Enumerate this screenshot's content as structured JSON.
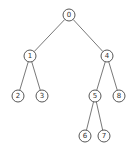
{
  "diagram": {
    "type": "binary-tree",
    "node_radius": 6,
    "colors": {
      "stroke": "#444444",
      "edge": "#555555",
      "fill": "#ffffff",
      "text": "#333333"
    },
    "nodes": [
      {
        "id": "0",
        "label": "0",
        "x": 69,
        "y": 15
      },
      {
        "id": "1",
        "label": "1",
        "x": 30,
        "y": 56
      },
      {
        "id": "4",
        "label": "4",
        "x": 107,
        "y": 56
      },
      {
        "id": "2",
        "label": "2",
        "x": 18,
        "y": 96
      },
      {
        "id": "3",
        "label": "3",
        "x": 42,
        "y": 96
      },
      {
        "id": "5",
        "label": "5",
        "x": 95,
        "y": 96
      },
      {
        "id": "8",
        "label": "8",
        "x": 119,
        "y": 96
      },
      {
        "id": "6",
        "label": "6",
        "x": 85,
        "y": 136
      },
      {
        "id": "7",
        "label": "7",
        "x": 104,
        "y": 136
      }
    ],
    "edges": [
      {
        "from": "0",
        "to": "1"
      },
      {
        "from": "0",
        "to": "4"
      },
      {
        "from": "1",
        "to": "2"
      },
      {
        "from": "1",
        "to": "3"
      },
      {
        "from": "4",
        "to": "5"
      },
      {
        "from": "4",
        "to": "8"
      },
      {
        "from": "5",
        "to": "6"
      },
      {
        "from": "5",
        "to": "7"
      }
    ]
  }
}
